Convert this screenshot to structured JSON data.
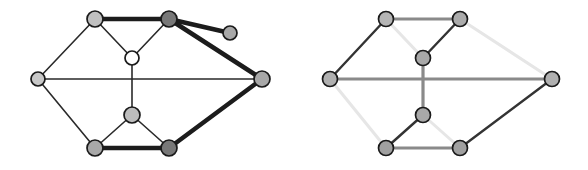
{
  "figure": {
    "title": "",
    "caption": "",
    "background": "#ffffff",
    "width": 588,
    "height": 170,
    "panel_count": 2
  },
  "palette": {
    "node_stroke": "#1a1a1a",
    "node_fill_white": "#ffffff",
    "node_fill_light": "#c8c8c8",
    "node_fill_mid": "#a8a8a8",
    "node_fill_dark": "#777777",
    "edge_dark": "#2a2a2a",
    "edge_bold": "#1c1c1c",
    "edge_mid": "#8a8a8a",
    "edge_pale": "#e2e2e2"
  },
  "chart_data": {
    "type": "diagram",
    "diagram_kind": "graph-pair",
    "panels": [
      {
        "name": "left-graph",
        "label": "",
        "node_count": 9,
        "edge_count": 13,
        "nodes": [
          {
            "id": "tl",
            "name": "top-left-node",
            "x": 95,
            "y": 19,
            "r": 8,
            "fill": "#c0c0c0"
          },
          {
            "id": "tr",
            "name": "top-right-node",
            "x": 169,
            "y": 19,
            "r": 8,
            "fill": "#787878"
          },
          {
            "id": "pd",
            "name": "pendant-node",
            "x": 230,
            "y": 33,
            "r": 7,
            "fill": "#a8a8a8"
          },
          {
            "id": "cu",
            "name": "upper-center-node",
            "x": 132,
            "y": 58,
            "r": 7,
            "fill": "#ffffff"
          },
          {
            "id": "lf",
            "name": "left-node",
            "x": 38,
            "y": 79,
            "r": 7,
            "fill": "#c8c8c8"
          },
          {
            "id": "rt",
            "name": "right-node",
            "x": 262,
            "y": 79,
            "r": 8,
            "fill": "#a8a8a8"
          },
          {
            "id": "cl",
            "name": "lower-center-node",
            "x": 132,
            "y": 115,
            "r": 8,
            "fill": "#bdbdbd"
          },
          {
            "id": "bl",
            "name": "bottom-left-node",
            "x": 95,
            "y": 148,
            "r": 8,
            "fill": "#a8a8a8"
          },
          {
            "id": "br",
            "name": "bottom-right-node",
            "x": 169,
            "y": 148,
            "r": 8,
            "fill": "#787878"
          }
        ],
        "edges": [
          {
            "from": "tl",
            "to": "tr",
            "weight": "bold",
            "color": "#1c1c1c",
            "width": 4.5
          },
          {
            "from": "tr",
            "to": "pd",
            "weight": "bold",
            "color": "#1c1c1c",
            "width": 4.5
          },
          {
            "from": "tr",
            "to": "rt",
            "weight": "bold",
            "color": "#1c1c1c",
            "width": 4.5
          },
          {
            "from": "rt",
            "to": "br",
            "weight": "bold",
            "color": "#1c1c1c",
            "width": 4.5
          },
          {
            "from": "bl",
            "to": "br",
            "weight": "bold",
            "color": "#1c1c1c",
            "width": 4.5
          },
          {
            "from": "tl",
            "to": "cu",
            "weight": "thin",
            "color": "#2a2a2a",
            "width": 1.6
          },
          {
            "from": "tr",
            "to": "cu",
            "weight": "thin",
            "color": "#2a2a2a",
            "width": 1.6
          },
          {
            "from": "tl",
            "to": "lf",
            "weight": "thin",
            "color": "#2a2a2a",
            "width": 1.6
          },
          {
            "from": "lf",
            "to": "rt",
            "weight": "thin",
            "color": "#2a2a2a",
            "width": 1.6
          },
          {
            "from": "lf",
            "to": "bl",
            "weight": "thin",
            "color": "#2a2a2a",
            "width": 1.6
          },
          {
            "from": "cu",
            "to": "cl",
            "weight": "thin",
            "color": "#2a2a2a",
            "width": 1.6
          },
          {
            "from": "cl",
            "to": "bl",
            "weight": "thin",
            "color": "#2a2a2a",
            "width": 1.6
          },
          {
            "from": "cl",
            "to": "br",
            "weight": "thin",
            "color": "#2a2a2a",
            "width": 1.6
          }
        ]
      },
      {
        "name": "right-graph",
        "label": "",
        "node_count": 8,
        "edge_count": 12,
        "nodes": [
          {
            "id": "tl",
            "name": "top-left-node",
            "x": 386,
            "y": 19,
            "r": 7.5,
            "fill": "#b5b5b5"
          },
          {
            "id": "tr",
            "name": "top-right-node",
            "x": 460,
            "y": 19,
            "r": 7.5,
            "fill": "#ababab"
          },
          {
            "id": "cu",
            "name": "upper-center-node",
            "x": 423,
            "y": 58,
            "r": 7.5,
            "fill": "#a8a8a8"
          },
          {
            "id": "lf",
            "name": "left-node",
            "x": 330,
            "y": 79,
            "r": 7.5,
            "fill": "#b0b0b0"
          },
          {
            "id": "rt",
            "name": "right-node",
            "x": 552,
            "y": 79,
            "r": 7.5,
            "fill": "#b0b0b0"
          },
          {
            "id": "cl",
            "name": "lower-center-node",
            "x": 423,
            "y": 115,
            "r": 7.5,
            "fill": "#a8a8a8"
          },
          {
            "id": "bl",
            "name": "bottom-left-node",
            "x": 386,
            "y": 148,
            "r": 7.5,
            "fill": "#a0a0a0"
          },
          {
            "id": "br",
            "name": "bottom-right-node",
            "x": 460,
            "y": 148,
            "r": 7.5,
            "fill": "#a0a0a0"
          }
        ],
        "edges": [
          {
            "from": "tl",
            "to": "tr",
            "weight": "mid",
            "color": "#8a8a8a",
            "width": 3.2
          },
          {
            "from": "tl",
            "to": "lf",
            "weight": "dark",
            "color": "#333333",
            "width": 2.4
          },
          {
            "from": "tl",
            "to": "cu",
            "weight": "pale",
            "color": "#e6e6e6",
            "width": 3.0
          },
          {
            "from": "tr",
            "to": "cu",
            "weight": "dark",
            "color": "#333333",
            "width": 2.4
          },
          {
            "from": "tr",
            "to": "rt",
            "weight": "pale",
            "color": "#e6e6e6",
            "width": 3.0
          },
          {
            "from": "lf",
            "to": "rt",
            "weight": "mid",
            "color": "#8a8a8a",
            "width": 3.2
          },
          {
            "from": "lf",
            "to": "bl",
            "weight": "pale",
            "color": "#e6e6e6",
            "width": 3.0
          },
          {
            "from": "cu",
            "to": "cl",
            "weight": "mid",
            "color": "#8a8a8a",
            "width": 3.2
          },
          {
            "from": "cl",
            "to": "bl",
            "weight": "dark",
            "color": "#333333",
            "width": 2.4
          },
          {
            "from": "cl",
            "to": "br",
            "weight": "pale",
            "color": "#e6e6e6",
            "width": 3.0
          },
          {
            "from": "bl",
            "to": "br",
            "weight": "mid",
            "color": "#8a8a8a",
            "width": 3.2
          },
          {
            "from": "br",
            "to": "rt",
            "weight": "dark",
            "color": "#333333",
            "width": 2.4
          }
        ]
      }
    ]
  }
}
